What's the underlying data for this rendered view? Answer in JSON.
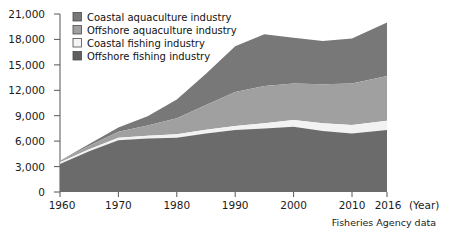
{
  "chart_data": {
    "type": "area",
    "stacked": true,
    "title": "",
    "xlabel": "(Year)",
    "ylabel": "",
    "source_note": "Fisheries Agency data",
    "x": [
      1960,
      1965,
      1970,
      1975,
      1980,
      1985,
      1990,
      1995,
      2000,
      2005,
      2010,
      2016
    ],
    "xtick_labels": [
      "1960",
      "1970",
      "1980",
      "1990",
      "2000",
      "2010",
      "2016"
    ],
    "xticks": [
      1960,
      1970,
      1980,
      1990,
      2000,
      2010,
      2016
    ],
    "xlim": [
      1960,
      2016
    ],
    "ytick_labels": [
      "0",
      "3,000",
      "6,000",
      "9,000",
      "12,000",
      "15,000",
      "18,000",
      "21,000"
    ],
    "yticks": [
      0,
      3000,
      6000,
      9000,
      12000,
      15000,
      18000,
      21000
    ],
    "ylim": [
      0,
      21000
    ],
    "grid": false,
    "legend_position": "top-left",
    "series": [
      {
        "name": "Offshore fishing industry",
        "color": "#6b6b6b",
        "stack_order": 1,
        "values": [
          3300,
          4800,
          6100,
          6300,
          6400,
          6900,
          7300,
          7500,
          7700,
          7200,
          6900,
          7300
        ]
      },
      {
        "name": "Coastal fishing industry",
        "color": "#f2f2f2",
        "stack_order": 2,
        "values": [
          200,
          250,
          300,
          350,
          400,
          450,
          500,
          600,
          800,
          900,
          1000,
          1100
        ]
      },
      {
        "name": "Offshore aquaculture industry",
        "color": "#a0a0a0",
        "stack_order": 3,
        "values": [
          200,
          400,
          700,
          1200,
          1900,
          2900,
          4000,
          4400,
          4300,
          4600,
          4900,
          5300
        ]
      },
      {
        "name": "Coastal aquaculture industry",
        "color": "#787878",
        "stack_order": 4,
        "values": [
          0,
          200,
          500,
          1100,
          2200,
          3700,
          5400,
          6100,
          5400,
          5100,
          5300,
          6300
        ]
      }
    ],
    "totals": [
      3700,
      5650,
      7600,
      8950,
      10900,
      13950,
      17200,
      18600,
      18200,
      17800,
      18100,
      20000
    ]
  },
  "legend": {
    "items": [
      {
        "label": "Coastal aquaculture industry",
        "color": "#787878"
      },
      {
        "label": "Offshore aquaculture industry",
        "color": "#a0a0a0"
      },
      {
        "label": "Coastal fishing industry",
        "color": "#f4f4f4"
      },
      {
        "label": "Offshore fishing industry",
        "color": "#5f5f5f"
      }
    ]
  },
  "axis": {
    "year_unit": "(Year)"
  }
}
